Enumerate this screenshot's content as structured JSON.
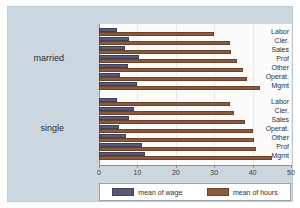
{
  "chart_data": {
    "type": "bar",
    "orientation": "horizontal",
    "title": "",
    "subtitle": "",
    "xlabel": "",
    "ylabel": "",
    "xlim": [
      0,
      50
    ],
    "xticks": [
      0,
      10,
      20,
      30,
      40,
      50
    ],
    "xticklabels": [
      "0",
      "10",
      "20",
      "30",
      "40",
      "50"
    ],
    "grid": true,
    "legend_position": "bottom",
    "group_labels": [
      "married",
      "single"
    ],
    "series": [
      {
        "name": "mean of wage",
        "key": "wage",
        "color": "#5a5a78"
      },
      {
        "name": "mean of hours",
        "key": "hours",
        "color": "#8a5a3f"
      }
    ],
    "groups": [
      {
        "label": "married",
        "categories": [
          "Labor",
          "Cler.",
          "Sales",
          "Prof",
          "Other",
          "Operat.",
          "Mgmt"
        ],
        "wage": [
          4.8,
          7.7,
          6.9,
          10.3,
          7.6,
          5.5,
          9.9
        ],
        "hours": [
          30.0,
          34.0,
          34.5,
          36.0,
          37.5,
          38.5,
          42.0
        ]
      },
      {
        "label": "single",
        "categories": [
          "Labor",
          "Cler.",
          "Sales",
          "Operat.",
          "Other",
          "Prof",
          "Mgmt"
        ],
        "wage": [
          4.6,
          9.2,
          7.8,
          5.3,
          7.0,
          11.3,
          12.0
        ],
        "hours": [
          34.0,
          35.2,
          38.0,
          40.0,
          40.3,
          41.0,
          45.0
        ]
      }
    ]
  },
  "legend": {
    "entries": [
      {
        "label": "mean of wage"
      },
      {
        "label": "mean of hours"
      }
    ]
  },
  "colors": {
    "wage": "#5a5a78",
    "hours": "#8a5a3f",
    "figure_background": "#ccd6de",
    "plot_background": "#fdfcfb",
    "axis": "#8d8f92",
    "gridline": "#e6eaee"
  }
}
